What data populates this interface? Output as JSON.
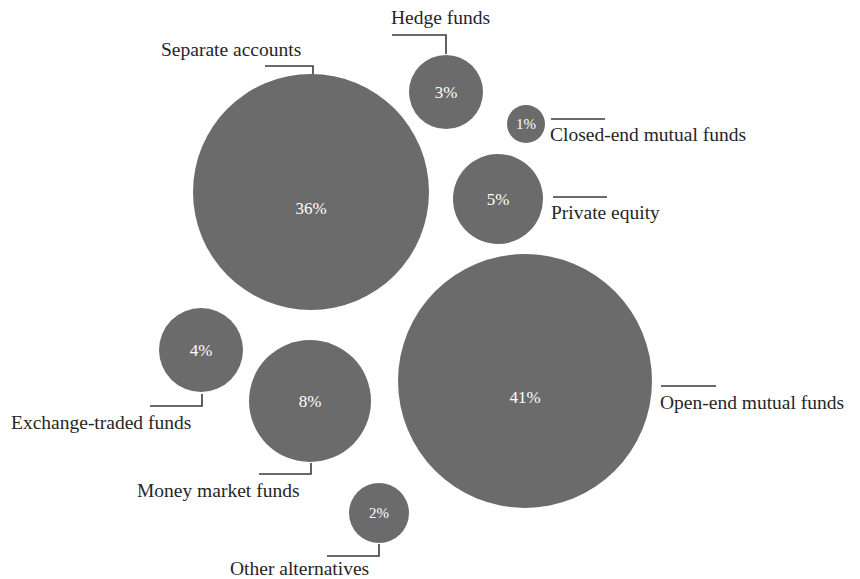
{
  "chart_data": {
    "type": "pie",
    "title": "",
    "subtitle": "",
    "xlabel": "",
    "ylabel": "",
    "legend_position": "none",
    "grid": false,
    "value_suffix": "%",
    "bubble_color": "#6b6b6b",
    "value_label_color": "#ffffff",
    "text_color": "#262626",
    "background": "#ffffff",
    "categories": [
      "Separate accounts",
      "Hedge funds",
      "Closed-end mutual funds",
      "Private equity",
      "Open-end mutual funds",
      "Exchange-traded funds",
      "Money market funds",
      "Other alternatives"
    ],
    "values": [
      36,
      3,
      1,
      5,
      41,
      4,
      8,
      2
    ],
    "bubbles": [
      {
        "name": "separate-accounts",
        "label": "Separate accounts",
        "value_text": "36%",
        "value": 36,
        "cx": 311,
        "cy": 192,
        "r": 118,
        "label_x": 161,
        "label_y": 56,
        "label_anchor": "start",
        "leader": "M265,66 H313 V79"
      },
      {
        "name": "hedge-funds",
        "label": "Hedge funds",
        "value_text": "3%",
        "value": 3,
        "cx": 446,
        "cy": 92,
        "r": 37,
        "label_x": 391,
        "label_y": 24,
        "label_anchor": "start",
        "leader": "M392,35 H446 V54"
      },
      {
        "name": "closed-end-mutual-funds",
        "label": "Closed-end mutual funds",
        "value_text": "1%",
        "value": 1,
        "cx": 526,
        "cy": 124,
        "r": 19,
        "label_x": 550,
        "label_y": 141,
        "label_anchor": "start",
        "leader": "M551,119 H605"
      },
      {
        "name": "private-equity",
        "label": "Private equity",
        "value_text": "5%",
        "value": 5,
        "cx": 498,
        "cy": 199,
        "r": 45,
        "label_x": 551,
        "label_y": 219,
        "label_anchor": "start",
        "leader": "M553,197 H607"
      },
      {
        "name": "open-end-mutual-funds",
        "label": "Open-end mutual funds",
        "value_text": "41%",
        "value": 41,
        "cx": 525,
        "cy": 381,
        "r": 127,
        "label_x": 660,
        "label_y": 409,
        "label_anchor": "start",
        "leader": "M661,386 H716"
      },
      {
        "name": "exchange-traded-funds",
        "label": "Exchange-traded funds",
        "value_text": "4%",
        "value": 4,
        "cx": 201,
        "cy": 350,
        "r": 42,
        "label_x": 11,
        "label_y": 429,
        "label_anchor": "start",
        "leader": "M150,406 H202 V394"
      },
      {
        "name": "money-market-funds",
        "label": "Money market funds",
        "value_text": "8%",
        "value": 8,
        "cx": 310,
        "cy": 401,
        "r": 61,
        "label_x": 137,
        "label_y": 497,
        "label_anchor": "start",
        "leader": "M259,474 H311 V463"
      },
      {
        "name": "other-alternatives",
        "label": "Other alternatives",
        "value_text": "2%",
        "value": 2,
        "cx": 379,
        "cy": 513,
        "r": 30,
        "label_x": 230,
        "label_y": 575,
        "label_anchor": "start",
        "leader": "M327,556 H379 V544"
      }
    ]
  }
}
